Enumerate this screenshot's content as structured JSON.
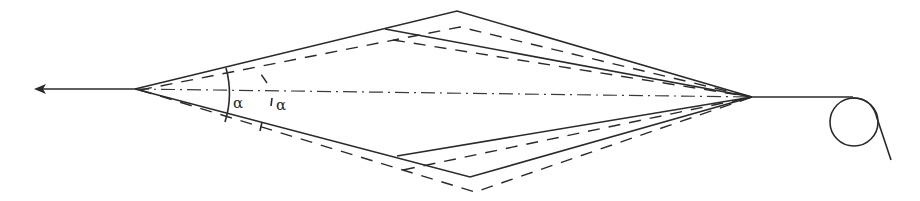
{
  "diagram": {
    "labels": {
      "alpha_solid": "α",
      "alpha_dashed": "α"
    },
    "colors": {
      "line": "#2a2a2a",
      "background": "#ffffff"
    },
    "geometry": {
      "left_apex": [
        135,
        89
      ],
      "right_apex": [
        752,
        97
      ],
      "solid_top_vertex": [
        457,
        11
      ],
      "solid_top_inner": [
        385,
        29
      ],
      "solid_bottom_vertex": [
        470,
        177
      ],
      "solid_bottom_inner": [
        397,
        156
      ],
      "dashed_top_vertex": [
        460,
        27
      ],
      "dashed_top_inner": [
        393,
        40
      ],
      "dashed_bottom_vertex": [
        475,
        192
      ],
      "dashed_bottom_inner": [
        403,
        170
      ],
      "roller_center": [
        854,
        122
      ],
      "roller_radius": 24,
      "arrow_tip": [
        35,
        89
      ]
    }
  }
}
